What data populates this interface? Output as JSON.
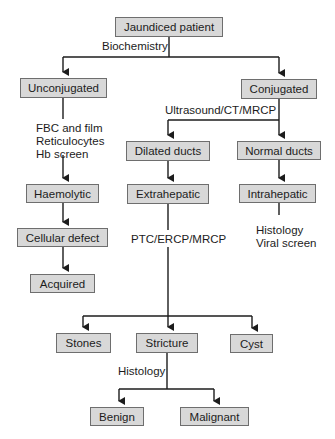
{
  "diagram": {
    "colors": {
      "box_fill": "#d8d8d8",
      "box_border": "#6e6e6e",
      "line": "#1c1c1c",
      "text": "#1c1c1c"
    },
    "nodes": {
      "root": "Jaundiced patient",
      "unconjugated": "Unconjugated",
      "conjugated": "Conjugated",
      "haemolytic": "Haemolytic",
      "cellular_defect": "Cellular defect",
      "acquired": "Acquired",
      "dilated_ducts": "Dilated ducts",
      "normal_ducts": "Normal ducts",
      "extrahepatic": "Extrahepatic",
      "intrahepatic": "Intrahepatic",
      "stones": "Stones",
      "stricture": "Stricture",
      "cyst": "Cyst",
      "benign": "Benign",
      "malignant": "Malignant"
    },
    "edge_labels": {
      "biochemistry": "Biochemistry",
      "ultrasound": "Ultrasound/CT/MRCP",
      "fbc_lines": [
        "FBC and film",
        "Reticulocytes",
        "Hb screen"
      ],
      "ptc": "PTC/ERCP/MRCP",
      "intra_tests": [
        "Histology",
        "Viral screen"
      ],
      "histology_stricture": "Histology"
    }
  }
}
